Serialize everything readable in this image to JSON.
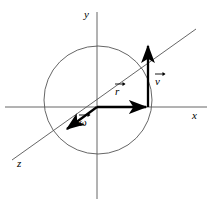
{
  "figure": {
    "background_color": "#ffffff",
    "axis_color": "#555555",
    "circle_color": "#555555",
    "vector_color": "#000000",
    "width": 213,
    "height": 215
  },
  "axes": [
    {
      "name": "y-axis",
      "label": "y",
      "orientation": "vertical"
    },
    {
      "name": "x-axis",
      "label": "x",
      "orientation": "horizontal"
    },
    {
      "name": "z-axis",
      "label": "z",
      "orientation": "diagonal"
    }
  ],
  "circle": {
    "name": "orbit-circle",
    "center_x": 98,
    "center_y": 100,
    "radius": 54
  },
  "vectors": [
    {
      "name": "radius-vector",
      "label": "r",
      "description": "radius vector along +x from origin to circle edge"
    },
    {
      "name": "velocity-vector",
      "label": "v",
      "description": "velocity vector pointing up at circle edge"
    },
    {
      "name": "angular-velocity-vector",
      "label": "ω",
      "description": "angular velocity vector along -z direction"
    }
  ]
}
